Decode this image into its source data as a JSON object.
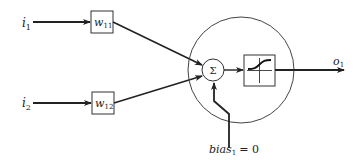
{
  "diagram": {
    "inputs": [
      {
        "name": "i",
        "sub": "1",
        "weight_name": "w",
        "weight_sub": "11"
      },
      {
        "name": "i",
        "sub": "2",
        "weight_name": "w",
        "weight_sub": "12"
      }
    ],
    "summation_symbol": "Σ",
    "activation": "sigmoid-icon",
    "output": {
      "name": "o",
      "sub": "1"
    },
    "bias": {
      "name": "bias",
      "sub": "1",
      "value_text": "= 0"
    },
    "colors": {
      "stroke": "#222222",
      "background": "#ffffff"
    }
  }
}
